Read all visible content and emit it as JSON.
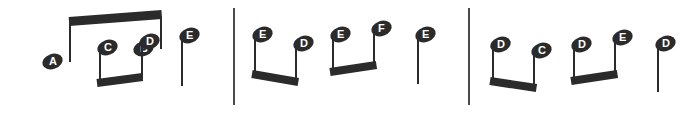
{
  "notation": {
    "type": "music-notation",
    "ink_color": "#2b2b2b",
    "barline_color": "#4a4a4a",
    "background": "#ffffff",
    "label_color": "#ffffff",
    "measures": [
      {
        "index": 1,
        "groups": [
          {
            "kind": "beamed-pair",
            "beam_direction": "up",
            "notes": [
              {
                "letter": "A",
                "x": 52,
                "y": 61,
                "stem_x": 69,
                "stem_top": 21,
                "stem_bottom": 62
              },
              {
                "letter": "B",
                "x": 143,
                "y": 48,
                "stem_x": 160,
                "stem_top": 16,
                "stem_bottom": 49
              }
            ],
            "beam": {
              "x1": 69,
              "y1": 21,
              "x2": 162,
              "y2": 14,
              "thickness": 9
            }
          },
          {
            "kind": "beamed-pair",
            "beam_direction": "down",
            "notes": [
              {
                "letter": "C",
                "x": 107,
                "y": 47,
                "stem_x": 99,
                "stem_top": 46,
                "stem_bottom": 83
              },
              {
                "letter": "D",
                "x": 149,
                "y": 41,
                "stem_x": 141,
                "stem_top": 40,
                "stem_bottom": 79
              }
            ],
            "beam": {
              "x1": 97,
              "y1": 83,
              "x2": 143,
              "y2": 77,
              "thickness": 8
            }
          },
          {
            "kind": "single-note",
            "notes": [
              {
                "letter": "E",
                "x": 189,
                "y": 35,
                "stem_x": 181,
                "stem_top": 34,
                "stem_bottom": 86
              }
            ]
          }
        ]
      },
      {
        "index": 2,
        "groups": [
          {
            "kind": "beamed-pair",
            "beam_direction": "down",
            "notes": [
              {
                "letter": "E",
                "x": 262,
                "y": 34,
                "stem_x": 254,
                "stem_top": 33,
                "stem_bottom": 78
              },
              {
                "letter": "D",
                "x": 303,
                "y": 43,
                "stem_x": 295,
                "stem_top": 42,
                "stem_bottom": 83
              }
            ],
            "beam": {
              "x1": 252,
              "y1": 74,
              "x2": 298,
              "y2": 82,
              "thickness": 8
            }
          },
          {
            "kind": "beamed-pair",
            "beam_direction": "down",
            "notes": [
              {
                "letter": "E",
                "x": 340,
                "y": 34,
                "stem_x": 332,
                "stem_top": 33,
                "stem_bottom": 72
              },
              {
                "letter": "F",
                "x": 381,
                "y": 28,
                "stem_x": 373,
                "stem_top": 27,
                "stem_bottom": 67
              }
            ],
            "beam": {
              "x1": 330,
              "y1": 72,
              "x2": 376,
              "y2": 65,
              "thickness": 8
            }
          },
          {
            "kind": "single-note",
            "notes": [
              {
                "letter": "E",
                "x": 425,
                "y": 34,
                "stem_x": 417,
                "stem_top": 33,
                "stem_bottom": 84
              }
            ]
          }
        ]
      },
      {
        "index": 3,
        "groups": [
          {
            "kind": "beamed-pair",
            "beam_direction": "down",
            "notes": [
              {
                "letter": "D",
                "x": 500,
                "y": 44,
                "stem_x": 492,
                "stem_top": 43,
                "stem_bottom": 85
              },
              {
                "letter": "C",
                "x": 541,
                "y": 50,
                "stem_x": 533,
                "stem_top": 49,
                "stem_bottom": 90
              }
            ],
            "beam": {
              "x1": 490,
              "y1": 81,
              "x2": 536,
              "y2": 88,
              "thickness": 8
            }
          },
          {
            "kind": "beamed-pair",
            "beam_direction": "down",
            "notes": [
              {
                "letter": "D",
                "x": 581,
                "y": 44,
                "stem_x": 573,
                "stem_top": 43,
                "stem_bottom": 82
              },
              {
                "letter": "E",
                "x": 622,
                "y": 37,
                "stem_x": 614,
                "stem_top": 36,
                "stem_bottom": 76
              }
            ],
            "beam": {
              "x1": 571,
              "y1": 81,
              "x2": 617,
              "y2": 74,
              "thickness": 8
            }
          },
          {
            "kind": "single-note",
            "notes": [
              {
                "letter": "D",
                "x": 665,
                "y": 43,
                "stem_x": 657,
                "stem_top": 42,
                "stem_bottom": 92
              }
            ]
          }
        ]
      }
    ],
    "barlines": [
      {
        "x": 233,
        "y_top": 8,
        "y_bottom": 105,
        "width": 2
      },
      {
        "x": 468,
        "y_top": 8,
        "y_bottom": 105,
        "width": 2
      }
    ]
  }
}
